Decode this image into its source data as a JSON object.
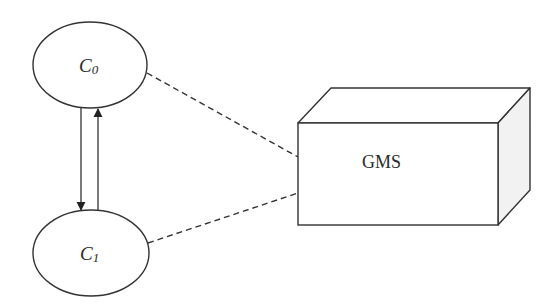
{
  "diagram": {
    "nodes": [
      {
        "id": "c0",
        "label_main": "C",
        "label_sub": "0",
        "shape": "ellipse"
      },
      {
        "id": "c1",
        "label_main": "C",
        "label_sub": "1",
        "shape": "ellipse"
      },
      {
        "id": "gms",
        "label": "GMS",
        "shape": "3d-box"
      }
    ],
    "edges": [
      {
        "from": "c0",
        "to": "c1",
        "style": "solid",
        "arrow": "end"
      },
      {
        "from": "c1",
        "to": "c0",
        "style": "solid",
        "arrow": "end"
      },
      {
        "from": "c0",
        "to": "gms",
        "style": "dashed",
        "arrow": "none"
      },
      {
        "from": "c1",
        "to": "gms",
        "style": "dashed",
        "arrow": "none"
      }
    ],
    "colors": {
      "stroke": "#333333",
      "box_side_fill": "#f2f2f2",
      "background": "#ffffff"
    }
  }
}
